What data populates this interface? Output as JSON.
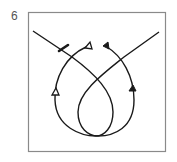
{
  "figure": {
    "label": "6",
    "colors": {
      "frame": "#8a8a8a",
      "stroke": "#1a1a1a",
      "label": "#555555"
    },
    "markers": [
      {
        "name": "bar-marker",
        "style": "bar"
      },
      {
        "name": "open-arrow-top",
        "style": "open-triangle"
      },
      {
        "name": "filled-arrow-top",
        "style": "filled-triangle"
      },
      {
        "name": "open-arrow-left",
        "style": "open-triangle"
      },
      {
        "name": "filled-arrow-right",
        "style": "filled-triangle"
      }
    ]
  }
}
